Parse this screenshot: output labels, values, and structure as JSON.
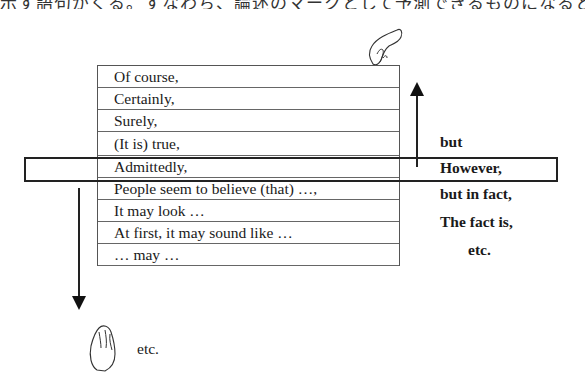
{
  "header": {
    "clipped_text": "示す語句がくる。すなわち、論述のマークとして予測できるものになるとよ"
  },
  "concession_list": {
    "items": [
      "Of course,",
      "Certainly,",
      "Surely,",
      "(It is) true,",
      "Admittedly,",
      "People seem to believe (that) …,",
      "It may look …",
      "At first, it may sound like …",
      "… may …"
    ],
    "etc": "etc.",
    "highlighted_index": 3
  },
  "contrast_list": {
    "items": [
      "but",
      "However,",
      "but in fact,",
      "The fact is,",
      "etc."
    ]
  },
  "icons": {
    "top_hand": "hand-pulling-icon",
    "bottom_hand": "hand-pulling-icon",
    "up_arrow": "arrow-up-icon",
    "down_arrow": "arrow-down-icon"
  }
}
